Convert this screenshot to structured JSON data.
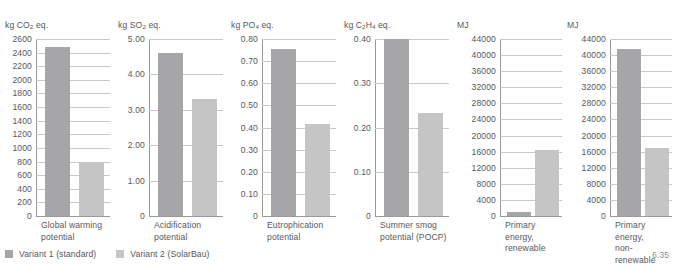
{
  "figure": {
    "number": "6.35",
    "legend": [
      {
        "label": "Variant 1 (standard)",
        "color": "#a6a6a8",
        "swatch": "series-1-swatch"
      },
      {
        "label": "Variant 2 (SolarBau)",
        "color": "#c5c5c6",
        "swatch": "series-2-swatch"
      }
    ]
  },
  "chart_data": [
    {
      "type": "bar",
      "title": "",
      "ylabel": "kg CO2 eq.",
      "ylabel_html": "kg CO<sub>2</sub> eq.",
      "xlabel": "",
      "categories": [
        "Global warming\npotential"
      ],
      "series": [
        {
          "name": "Variant 1 (standard)",
          "values": [
            2490
          ]
        },
        {
          "name": "Variant 2 (SolarBau)",
          "values": [
            800
          ]
        }
      ],
      "ylim": [
        0,
        2600
      ],
      "ytick_step": 200,
      "yticks": [
        "2600",
        "2400",
        "2200",
        "2000",
        "1800",
        "1600",
        "1400",
        "1200",
        "1000",
        "800",
        "600",
        "400",
        "200",
        "0"
      ],
      "grid": true,
      "legend_position": "below-figure"
    },
    {
      "type": "bar",
      "title": "",
      "ylabel": "kg SO2 eq.",
      "ylabel_html": "kg SO<sub>2</sub> eq.",
      "xlabel": "",
      "categories": [
        "Acidification\npotential"
      ],
      "series": [
        {
          "name": "Variant 1 (standard)",
          "values": [
            4.6
          ]
        },
        {
          "name": "Variant 2 (SolarBau)",
          "values": [
            3.3
          ]
        }
      ],
      "ylim": [
        0,
        5.0
      ],
      "ytick_step": 1.0,
      "yticks": [
        "5.00",
        "4.00",
        "3.00",
        "2.00",
        "1.00",
        "0"
      ],
      "grid": true,
      "legend_position": "below-figure"
    },
    {
      "type": "bar",
      "title": "",
      "ylabel": "kg PO4 eq.",
      "ylabel_html": "kg PO<sub>4</sub> eq.",
      "xlabel": "",
      "categories": [
        "Eutrophication\npotential"
      ],
      "series": [
        {
          "name": "Variant 1 (standard)",
          "values": [
            0.757
          ]
        },
        {
          "name": "Variant 2 (SolarBau)",
          "values": [
            0.415
          ]
        }
      ],
      "ylim": [
        0,
        0.8
      ],
      "ytick_step": 0.1,
      "yticks": [
        "0.80",
        "0.70",
        "0.60",
        "0.50",
        "0.40",
        "0.30",
        "0.20",
        "0.10",
        "0"
      ],
      "grid": true,
      "legend_position": "below-figure"
    },
    {
      "type": "bar",
      "title": "",
      "ylabel": "kg C2H4 eq.",
      "ylabel_html": "kg C<sub>2</sub>H<sub>4</sub> eq.",
      "xlabel": "",
      "categories": [
        "Summer smog\npotential (POCP)"
      ],
      "series": [
        {
          "name": "Variant 1 (standard)",
          "values": [
            0.4
          ]
        },
        {
          "name": "Variant 2 (SolarBau)",
          "values": [
            0.233
          ]
        }
      ],
      "ylim": [
        0,
        0.4
      ],
      "ytick_step": 0.1,
      "yticks": [
        "0.40",
        "0.30",
        "0.20",
        "0.10",
        "0"
      ],
      "grid": true,
      "legend_position": "below-figure"
    },
    {
      "type": "bar",
      "title": "",
      "ylabel": "MJ",
      "ylabel_html": "MJ",
      "xlabel": "",
      "categories": [
        "Primary energy,\nrenewable"
      ],
      "series": [
        {
          "name": "Variant 1 (standard)",
          "values": [
            900
          ]
        },
        {
          "name": "Variant 2 (SolarBau)",
          "values": [
            16300
          ]
        }
      ],
      "ylim": [
        0,
        44000
      ],
      "ytick_step": 4000,
      "yticks": [
        "44000",
        "40000",
        "36000",
        "32000",
        "28000",
        "24000",
        "20000",
        "16000",
        "12000",
        "8000",
        "4000",
        "0"
      ],
      "grid": true,
      "legend_position": "below-figure"
    },
    {
      "type": "bar",
      "title": "",
      "ylabel": "MJ",
      "ylabel_html": "MJ",
      "xlabel": "",
      "categories": [
        "Primary energy,\nnon-renewable"
      ],
      "series": [
        {
          "name": "Variant 1 (standard)",
          "values": [
            41500
          ]
        },
        {
          "name": "Variant 2 (SolarBau)",
          "values": [
            17000
          ]
        }
      ],
      "ylim": [
        0,
        44000
      ],
      "ytick_step": 4000,
      "yticks": [
        "44000",
        "40000",
        "36000",
        "32000",
        "28000",
        "24000",
        "20000",
        "16000",
        "12000",
        "8000",
        "4000",
        "0"
      ],
      "grid": true,
      "legend_position": "below-figure"
    }
  ]
}
